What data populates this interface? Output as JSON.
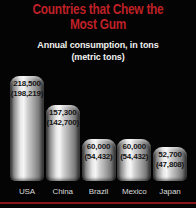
{
  "title": {
    "line1": "Countries that Chew the",
    "line2": "Most Gum"
  },
  "subtitle": {
    "line1": "Annual consumption, in tons",
    "line2": "(metric tons)"
  },
  "colors": {
    "background": "#040404",
    "title_red": "#bf2026",
    "subtitle_white": "#f2f2f2",
    "bar_value_text": "#141414",
    "country_label": "#d9d9d9",
    "bottom_rule_red": "#8a181b"
  },
  "chart_data": {
    "type": "bar",
    "title": "Countries that Chew the Most Gum",
    "subtitle": "Annual consumption, in tons (metric tons)",
    "categories": [
      "USA",
      "China",
      "Brazil",
      "Mexico",
      "Japan"
    ],
    "series": [
      {
        "name": "tons",
        "values": [
          218500,
          157300,
          60000,
          60000,
          52700
        ]
      },
      {
        "name": "metric tons",
        "values": [
          198219,
          142700,
          54432,
          54432,
          47808
        ]
      }
    ],
    "legend": "none",
    "grid": false,
    "bars": [
      {
        "country": "USA",
        "tons_label": "218,500",
        "metric_label": "(198,219)",
        "height_px": 105
      },
      {
        "country": "China",
        "tons_label": "157,300",
        "metric_label": "(142,700)",
        "height_px": 76
      },
      {
        "country": "Brazil",
        "tons_label": "60,000",
        "metric_label": "(54,432)",
        "height_px": 42
      },
      {
        "country": "Mexico",
        "tons_label": "60,000",
        "metric_label": "(54,432)",
        "height_px": 42
      },
      {
        "country": "Japan",
        "tons_label": "52,700",
        "metric_label": "(47,808)",
        "height_px": 34
      }
    ]
  }
}
